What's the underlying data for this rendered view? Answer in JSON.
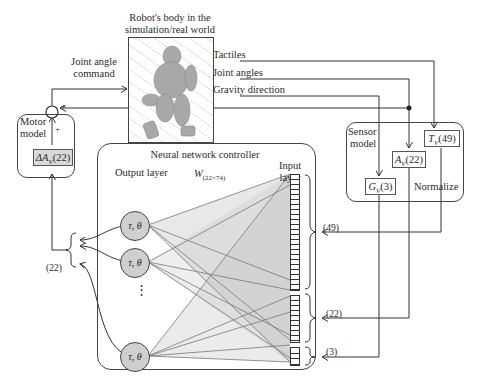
{
  "robot": {
    "title_line1": "Robot's body in the",
    "title_line2": "simulation/real world",
    "image_alt": "humanoid-robot-render"
  },
  "command_label": {
    "line1": "Joint angle",
    "line2": "command"
  },
  "sensor_outputs": [
    "Tactiles",
    "Joint angles",
    "Gravity direction"
  ],
  "motor_model": {
    "label_line1": "Motor",
    "label_line2": "model",
    "sum_signs": [
      "+",
      "+"
    ],
    "delta_box": "ΔA",
    "delta_sub": "V",
    "delta_count": "(22)"
  },
  "sensor_model": {
    "label_line1": "Sensor",
    "label_line2": "model",
    "tactile_box": "T",
    "tactile_sub": "V",
    "tactile_count": "(49)",
    "angle_box": "A",
    "angle_sub": "V",
    "angle_count": "(22)",
    "gravity_box": "G",
    "gravity_sub": "V",
    "gravity_count": "(3)",
    "normalize_label": "Normalize"
  },
  "controller": {
    "title": "Neural network controller",
    "output_layer_label": "Output layer",
    "input_layer_label_line1": "Input",
    "input_layer_label_line2": "layer",
    "weight_label": "W",
    "weight_sub": "(22×74)",
    "node_label": "τ, θ",
    "ellipsis": "⋮"
  },
  "group_counts": {
    "output": "(22)",
    "tactile_in": "(49)",
    "angle_in": "(22)",
    "gravity_in": "(3)"
  }
}
